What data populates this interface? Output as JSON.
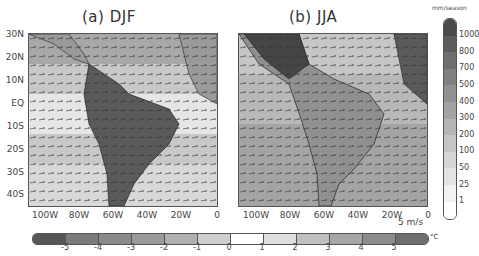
{
  "panels": [
    {
      "title": "(a) DJF",
      "id": "djf"
    },
    {
      "title": "(b) JJA",
      "id": "jja"
    }
  ],
  "y_axis_labels": [
    "30N",
    "20N",
    "10N",
    "EQ",
    "10S",
    "20S",
    "30S",
    "40S"
  ],
  "x_axis_labels": [
    "100W",
    "80W",
    "60W",
    "40W",
    "20W",
    "0"
  ],
  "precip_colorbar": {
    "unit": "mm/season",
    "labels": [
      "1000",
      "800",
      "700",
      "500",
      "400",
      "300",
      "200",
      "100",
      "50",
      "25",
      "1"
    ],
    "colors": [
      "#4a4a4a",
      "#5c5c5c",
      "#6e6e6e",
      "#808080",
      "#919191",
      "#a3a3a3",
      "#b5b5b5",
      "#c6c6c6",
      "#d6d6d6",
      "#e4e4e4",
      "#f2f2f2",
      "#ffffff"
    ]
  },
  "temp_colorbar": {
    "unit": "°C",
    "labels": [
      "-5",
      "-4",
      "-3",
      "-2",
      "-1",
      "0",
      "1",
      "2",
      "3",
      "4",
      "5"
    ],
    "colors": [
      "#555555",
      "#7a7a7a",
      "#8a8a8a",
      "#9a9a9a",
      "#b0b0b0",
      "#cfcfcf",
      "#ffffff",
      "#dedede",
      "#c0c0c0",
      "#a6a6a6",
      "#8c8c8c",
      "#6e6e6e"
    ]
  },
  "vector_reference": "5 m/s"
}
